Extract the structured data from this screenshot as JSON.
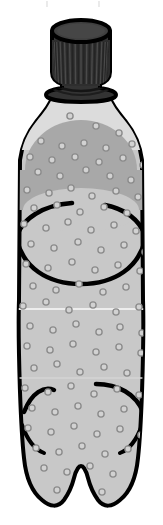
{
  "image": {
    "title": "Clear plastic soda bottle",
    "subject": "plastic-bottle",
    "alt_text": "Illustration of a capped clear plastic carbonated drink bottle with bubbles",
    "width": 163,
    "height": 525,
    "background_color": "#ffffff",
    "style": "flat clip-art line illustration"
  },
  "colors": {
    "outline": "#000000",
    "cap_top_fill": "#3d3d3d",
    "cap_body_fill": "#333333",
    "cap_ridge_dark": "#242424",
    "cap_collar_fill": "#3a3a3a",
    "neck_fill": "#dcdcdc",
    "body_fill": "#c8c8c8",
    "liquid_fill": "#a8a8a8",
    "bubble_stroke": "#8c8c8c",
    "bubble_fill": "#d2d2d2",
    "highlight": "#f0f0f0"
  },
  "parts": [
    {
      "id": "cap",
      "label": "Screw cap",
      "color": "#3d3d3d"
    },
    {
      "id": "cap-ridges",
      "label": "Cap knurling ridges",
      "color": "#242424"
    },
    {
      "id": "cap-collar",
      "label": "Cap tamper collar",
      "color": "#3a3a3a"
    },
    {
      "id": "neck",
      "label": "Bottle neck",
      "color": "#dcdcdc"
    },
    {
      "id": "shoulder",
      "label": "Bottle shoulder",
      "color": "#dcdcdc"
    },
    {
      "id": "liquid",
      "label": "Liquid fill level",
      "color": "#a8a8a8"
    },
    {
      "id": "body",
      "label": "Bottle body",
      "color": "#c8c8c8"
    },
    {
      "id": "contour-ring",
      "label": "Mid-body contour ring",
      "color": "#000000"
    },
    {
      "id": "grip-curves",
      "label": "Lower grip curves",
      "color": "#000000"
    },
    {
      "id": "base",
      "label": "Petaloid base",
      "color": "#c8c8c8"
    },
    {
      "id": "bubbles",
      "label": "Carbonation bubbles",
      "color": "#8c8c8c"
    }
  ],
  "cap": {
    "ridge_count": 30,
    "top_center_x": 81,
    "top_center_y": 31,
    "top_rx": 29,
    "top_ry": 11
  },
  "bubbles": {
    "count": 62,
    "radius": 3.1,
    "points": [
      [
        70,
        116
      ],
      [
        96,
        126
      ],
      [
        119,
        133
      ],
      [
        41,
        141
      ],
      [
        62,
        146
      ],
      [
        84,
        143
      ],
      [
        106,
        148
      ],
      [
        132,
        144
      ],
      [
        30,
        157
      ],
      [
        52,
        160
      ],
      [
        75,
        157
      ],
      [
        99,
        162
      ],
      [
        123,
        158
      ],
      [
        143,
        165
      ],
      [
        38,
        172
      ],
      [
        60,
        176
      ],
      [
        86,
        170
      ],
      [
        110,
        176
      ],
      [
        131,
        180
      ],
      [
        27,
        190
      ],
      [
        49,
        193
      ],
      [
        71,
        188
      ],
      [
        92,
        196
      ],
      [
        116,
        191
      ],
      [
        138,
        197
      ],
      [
        34,
        208
      ],
      [
        57,
        205
      ],
      [
        80,
        212
      ],
      [
        104,
        207
      ],
      [
        127,
        213
      ],
      [
        24,
        224
      ],
      [
        46,
        228
      ],
      [
        68,
        222
      ],
      [
        91,
        230
      ],
      [
        114,
        225
      ],
      [
        136,
        231
      ],
      [
        31,
        244
      ],
      [
        54,
        248
      ],
      [
        78,
        242
      ],
      [
        101,
        250
      ],
      [
        124,
        245
      ],
      [
        145,
        252
      ],
      [
        26,
        264
      ],
      [
        48,
        268
      ],
      [
        72,
        262
      ],
      [
        95,
        270
      ],
      [
        118,
        265
      ],
      [
        140,
        271
      ],
      [
        33,
        286
      ],
      [
        56,
        290
      ],
      [
        79,
        284
      ],
      [
        103,
        292
      ],
      [
        126,
        287
      ],
      [
        23,
        306
      ],
      [
        46,
        302
      ],
      [
        69,
        310
      ],
      [
        93,
        305
      ],
      [
        116,
        312
      ],
      [
        139,
        307
      ],
      [
        30,
        326
      ],
      [
        53,
        330
      ],
      [
        76,
        324
      ],
      [
        99,
        332
      ]
    ]
  },
  "lower_bubbles": {
    "points": [
      [
        120,
        327
      ],
      [
        142,
        333
      ],
      [
        27,
        346
      ],
      [
        50,
        350
      ],
      [
        73,
        344
      ],
      [
        96,
        352
      ],
      [
        119,
        347
      ],
      [
        141,
        353
      ],
      [
        34,
        368
      ],
      [
        57,
        364
      ],
      [
        80,
        372
      ],
      [
        104,
        367
      ],
      [
        127,
        373
      ],
      [
        25,
        388
      ],
      [
        48,
        392
      ],
      [
        71,
        386
      ],
      [
        94,
        394
      ],
      [
        117,
        389
      ],
      [
        139,
        395
      ],
      [
        32,
        408
      ],
      [
        55,
        412
      ],
      [
        78,
        406
      ],
      [
        101,
        414
      ],
      [
        124,
        409
      ],
      [
        28,
        428
      ],
      [
        51,
        432
      ],
      [
        74,
        426
      ],
      [
        97,
        434
      ],
      [
        120,
        429
      ],
      [
        141,
        435
      ],
      [
        36,
        448
      ],
      [
        59,
        452
      ],
      [
        82,
        446
      ],
      [
        105,
        454
      ],
      [
        128,
        449
      ],
      [
        44,
        468
      ],
      [
        67,
        472
      ],
      [
        90,
        466
      ],
      [
        113,
        474
      ],
      [
        57,
        490
      ],
      [
        80,
        486
      ],
      [
        102,
        492
      ]
    ]
  },
  "metrics": {
    "bottle_left_x": 18,
    "bottle_right_x": 146,
    "cap_top_y": 20,
    "base_bottom_y": 512,
    "liquid_line_y": 124,
    "contour_ring_y": 248
  },
  "labels": {
    "scene": "Plastic bottle illustration",
    "cap": "Bottle cap",
    "body": "Bottle body",
    "base": "Bottle base"
  }
}
